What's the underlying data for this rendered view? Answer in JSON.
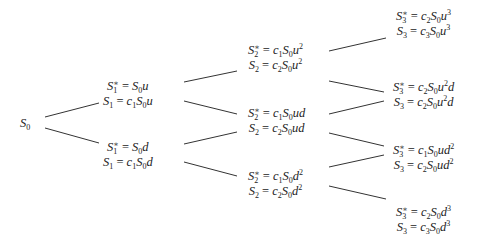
{
  "diagram": {
    "type": "binomial-tree",
    "root": {
      "id": "n0",
      "label": "S_0",
      "x": 20,
      "y": 116
    },
    "nodes": [
      {
        "id": "n1u",
        "x": 103,
        "y": 79,
        "lines": [
          {
            "lhs": "S_1^*",
            "rhs": "S_0 u"
          },
          {
            "lhs": "S_1",
            "rhs": "c_1 S_0 u"
          }
        ]
      },
      {
        "id": "n1d",
        "x": 103,
        "y": 140,
        "lines": [
          {
            "lhs": "S_1^*",
            "rhs": "S_0 d"
          },
          {
            "lhs": "S_1",
            "rhs": "c_1 S_0 d"
          }
        ]
      },
      {
        "id": "n2uu",
        "x": 248,
        "y": 43,
        "lines": [
          {
            "lhs": "S_2^*",
            "rhs": "c_1 S_0 u^2"
          },
          {
            "lhs": "S_2",
            "rhs": "c_2 S_0 u^2"
          }
        ]
      },
      {
        "id": "n2ud",
        "x": 248,
        "y": 106,
        "lines": [
          {
            "lhs": "S_2^*",
            "rhs": "c_1 S_0 ud"
          },
          {
            "lhs": "S_2",
            "rhs": "c_2 S_0 ud"
          }
        ]
      },
      {
        "id": "n2dd",
        "x": 248,
        "y": 169,
        "lines": [
          {
            "lhs": "S_2^*",
            "rhs": "c_1 S_0 d^2"
          },
          {
            "lhs": "S_2",
            "rhs": "c_2 S_0 d^2"
          }
        ]
      },
      {
        "id": "n3uuu",
        "x": 396,
        "y": 9,
        "lines": [
          {
            "lhs": "S_3^*",
            "rhs": "c_2 S_0 u^3"
          },
          {
            "lhs": "S_3",
            "rhs": "c_3 S_0 u^3"
          }
        ]
      },
      {
        "id": "n3uud",
        "x": 393,
        "y": 80,
        "lines": [
          {
            "lhs": "S_3^*",
            "rhs": "c_2 S_0 u^2 d"
          },
          {
            "lhs": "S_3",
            "rhs": "c_2 S_0 u^2 d"
          }
        ]
      },
      {
        "id": "n3udd",
        "x": 393,
        "y": 143,
        "lines": [
          {
            "lhs": "S_3^*",
            "rhs": "c_1 S_0 ud^2"
          },
          {
            "lhs": "S_3",
            "rhs": "c_2 S_0 ud^2"
          }
        ]
      },
      {
        "id": "n3ddd",
        "x": 396,
        "y": 205,
        "lines": [
          {
            "lhs": "S_3^*",
            "rhs": "c_2 S_0 d^3"
          },
          {
            "lhs": "S_3",
            "rhs": "c_3 S_0 d^3"
          }
        ]
      }
    ],
    "edges": [
      {
        "from": "n0",
        "to": "n1u",
        "x1": 45,
        "y1": 117,
        "x2": 99,
        "y2": 103
      },
      {
        "from": "n0",
        "to": "n1d",
        "x1": 45,
        "y1": 128,
        "x2": 99,
        "y2": 143
      },
      {
        "from": "n1u",
        "to": "n2uu",
        "x1": 184,
        "y1": 82,
        "x2": 237,
        "y2": 71
      },
      {
        "from": "n1u",
        "to": "n2ud",
        "x1": 184,
        "y1": 101,
        "x2": 237,
        "y2": 114
      },
      {
        "from": "n1d",
        "to": "n2ud",
        "x1": 184,
        "y1": 144,
        "x2": 237,
        "y2": 132
      },
      {
        "from": "n1d",
        "to": "n2dd",
        "x1": 184,
        "y1": 162,
        "x2": 237,
        "y2": 176
      },
      {
        "from": "n2uu",
        "to": "n3uuu",
        "x1": 329,
        "y1": 51,
        "x2": 386,
        "y2": 38
      },
      {
        "from": "n2uu",
        "to": "n3uud",
        "x1": 329,
        "y1": 81,
        "x2": 384,
        "y2": 92
      },
      {
        "from": "n2ud",
        "to": "n3uud",
        "x1": 329,
        "y1": 114,
        "x2": 384,
        "y2": 101
      },
      {
        "from": "n2ud",
        "to": "n3udd",
        "x1": 329,
        "y1": 133,
        "x2": 384,
        "y2": 146
      },
      {
        "from": "n2dd",
        "to": "n3udd",
        "x1": 329,
        "y1": 167,
        "x2": 384,
        "y2": 155
      },
      {
        "from": "n2dd",
        "to": "n3ddd",
        "x1": 329,
        "y1": 186,
        "x2": 386,
        "y2": 199
      }
    ],
    "edge_color": "#333333"
  }
}
